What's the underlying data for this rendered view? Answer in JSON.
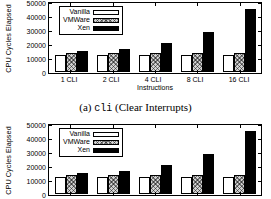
{
  "figure": {
    "caption_prefix": "(a) ",
    "caption_code": "cli",
    "caption_suffix": " (Clear Interrupts)"
  },
  "chart_data": [
    {
      "type": "bar",
      "title": "",
      "xlabel": "Instructions",
      "ylabel": "CPU Cycles Elapsed",
      "categories": [
        "1 CLI",
        "2 CLI",
        "4 CLI",
        "8 CLI",
        "16 CLI"
      ],
      "series": [
        {
          "name": "Vanilla",
          "values": [
            12400,
            12300,
            12300,
            12300,
            12300
          ]
        },
        {
          "name": "VMWare",
          "values": [
            13600,
            13700,
            13600,
            13600,
            13900
          ]
        },
        {
          "name": "Xen",
          "values": [
            14700,
            16500,
            20600,
            28800,
            44900
          ]
        }
      ],
      "ylim": [
        0,
        50000
      ],
      "yticks": [
        "0",
        "10000",
        "20000",
        "30000",
        "40000",
        "50000"
      ],
      "ytick_values": [
        0,
        10000,
        20000,
        30000,
        40000,
        50000
      ],
      "grid": false,
      "legend_position": "top-left"
    },
    {
      "type": "bar",
      "title": "",
      "xlabel": "",
      "ylabel": "CPU Cycles Elapsed",
      "categories": [
        "1 CLI",
        "2 CLI",
        "4 CLI",
        "8 CLI",
        "16 CLI"
      ],
      "series": [
        {
          "name": "Vanilla",
          "values": [
            12400,
            12300,
            12300,
            12300,
            12300
          ]
        },
        {
          "name": "VMWare",
          "values": [
            13600,
            13700,
            13600,
            13600,
            13900
          ]
        },
        {
          "name": "Xen",
          "values": [
            14700,
            16500,
            20600,
            28800,
            44900
          ]
        }
      ],
      "ylim": [
        0,
        50000
      ],
      "yticks": [
        "0",
        "10000",
        "20000",
        "30000",
        "40000",
        "50000"
      ],
      "ytick_values": [
        0,
        10000,
        20000,
        30000,
        40000,
        50000
      ],
      "grid": false,
      "legend_position": "top-left"
    }
  ]
}
